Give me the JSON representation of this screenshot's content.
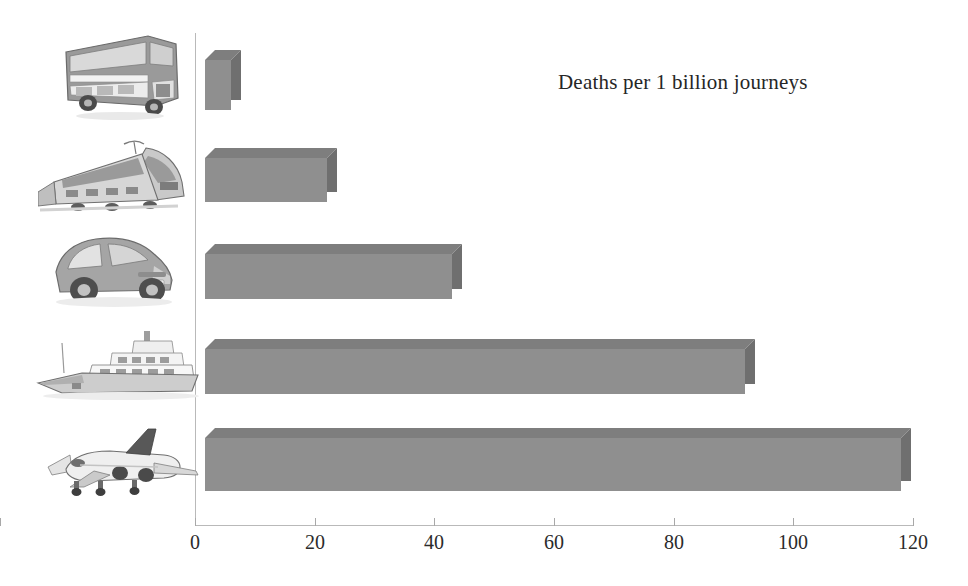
{
  "chart_data": {
    "type": "bar",
    "orientation": "horizontal",
    "title": "Deaths per 1 billion journeys",
    "xlabel": "",
    "ylabel": "",
    "xlim": [
      0,
      120
    ],
    "xticks": [
      0,
      20,
      40,
      60,
      80,
      100,
      120
    ],
    "xtick_labels": [
      "0",
      "20",
      "40",
      "60",
      "80",
      "100",
      "120"
    ],
    "grid": false,
    "legend": null,
    "categories": [
      "Bus",
      "Train",
      "Car",
      "Ship",
      "Plane"
    ],
    "values": [
      6,
      22,
      43,
      92,
      118
    ],
    "bar_color": "#8f8f8f",
    "bar_top_color": "#7e7e7e",
    "bar_side_color": "#6f6f6f",
    "axis_color": "#b9b9b9",
    "text_color": "#262626",
    "bars": [
      {
        "category": "Bus",
        "value": 6,
        "icon": "double-decker-bus-icon"
      },
      {
        "category": "Train",
        "value": 22,
        "icon": "high-speed-train-icon"
      },
      {
        "category": "Car",
        "value": 43,
        "icon": "hatchback-car-icon"
      },
      {
        "category": "Ship",
        "value": 92,
        "icon": "yacht-ship-icon"
      },
      {
        "category": "Plane",
        "value": 118,
        "icon": "airplane-icon"
      }
    ]
  },
  "axis": {
    "ticks": [
      {
        "label": "0",
        "value": 0
      },
      {
        "label": "20",
        "value": 20
      },
      {
        "label": "40",
        "value": 40
      },
      {
        "label": "60",
        "value": 60
      },
      {
        "label": "80",
        "value": 80
      },
      {
        "label": "100",
        "value": 100
      },
      {
        "label": "120",
        "value": 120
      }
    ]
  },
  "icons": {
    "bus": "double-decker-bus-icon",
    "train": "high-speed-train-icon",
    "car": "hatchback-car-icon",
    "ship": "yacht-ship-icon",
    "plane": "airplane-icon"
  }
}
